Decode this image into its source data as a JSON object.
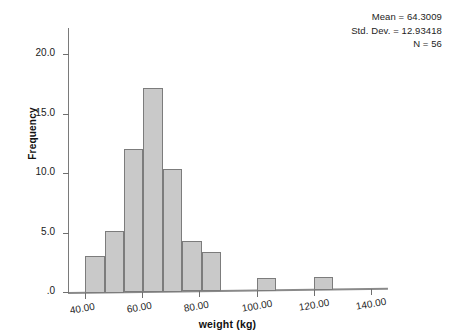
{
  "chart_data": {
    "type": "bar",
    "title": "",
    "subtitle": "",
    "xlabel": "weight (kg)",
    "ylabel": "Frequency",
    "xlim": [
      34,
      146
    ],
    "ylim": [
      0,
      22.2
    ],
    "grid": false,
    "legend_position": "none",
    "x_tick_labels": [
      "40.00",
      "60.00",
      "80.00",
      "100.00",
      "120.00",
      "140.00"
    ],
    "x_tick_values": [
      40,
      60,
      80,
      100,
      120,
      140
    ],
    "y_tick_labels": [
      ".0",
      "5.0",
      "10.0",
      "15.0",
      "20.0"
    ],
    "y_tick_values": [
      0,
      5,
      10,
      15,
      20
    ],
    "bin_width": 6.8,
    "bins": [
      {
        "start": 40.0,
        "end": 46.8,
        "value": 3.0
      },
      {
        "start": 46.8,
        "end": 53.6,
        "value": 5.1
      },
      {
        "start": 53.6,
        "end": 60.4,
        "value": 12.0
      },
      {
        "start": 60.4,
        "end": 67.2,
        "value": 17.1
      },
      {
        "start": 67.2,
        "end": 74.0,
        "value": 10.2
      },
      {
        "start": 74.0,
        "end": 80.8,
        "value": 4.2
      },
      {
        "start": 80.8,
        "end": 87.6,
        "value": 3.2
      },
      {
        "start": 100.0,
        "end": 106.8,
        "value": 1.0
      },
      {
        "start": 120.0,
        "end": 126.8,
        "value": 1.0
      }
    ],
    "categories": [
      "40.0-46.8",
      "46.8-53.6",
      "53.6-60.4",
      "60.4-67.2",
      "67.2-74.0",
      "74.0-80.8",
      "80.8-87.6",
      "100.0-106.8",
      "120.0-126.8"
    ],
    "values": [
      3.0,
      5.1,
      12.0,
      17.1,
      10.2,
      4.2,
      3.2,
      1.0,
      1.0
    ],
    "annotations": {
      "mean_label": "Mean = 64.3009",
      "std_dev_label": "Std. Dev. = 12.93418",
      "n_label": "N = 56",
      "mean": 64.3009,
      "std_dev": 12.93418,
      "n": 56
    },
    "colors": {
      "bar_fill": "#c9c9c9",
      "bar_stroke": "#7c7c7c",
      "axis": "#7a7a7a",
      "text": "#1a1a1a"
    }
  }
}
